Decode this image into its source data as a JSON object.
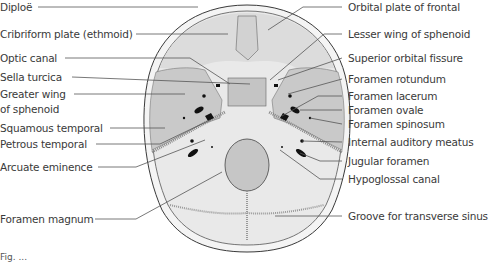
{
  "figure": {
    "caption_fragment": "Fig. ..."
  },
  "labels_left": [
    {
      "text": "Diploë",
      "y": 7
    },
    {
      "text": "Cribriform plate (ethmoid)",
      "y": 34
    },
    {
      "text": "Optic canal",
      "y": 58
    },
    {
      "text": "Sella turcica",
      "y": 77
    },
    {
      "text": "Greater wing",
      "y": 94
    },
    {
      "text": "of sphenoid",
      "y": 109
    },
    {
      "text": "Squamous temporal",
      "y": 128
    },
    {
      "text": "Petrous temporal",
      "y": 144
    },
    {
      "text": "Arcuate eminence",
      "y": 167
    },
    {
      "text": "Foramen magnum",
      "y": 219
    }
  ],
  "labels_right": [
    {
      "text": "Orbital plate of frontal",
      "y": 7
    },
    {
      "text": "Lesser wing of sphenoid",
      "y": 34
    },
    {
      "text": "Superior orbital fissure",
      "y": 58
    },
    {
      "text": "Foramen rotundum",
      "y": 79
    },
    {
      "text": "Foramen lacerum",
      "y": 96
    },
    {
      "text": "Foramen ovale",
      "y": 110
    },
    {
      "text": "Foramen spinosum",
      "y": 124
    },
    {
      "text": "Internal auditory meatus",
      "y": 142
    },
    {
      "text": "Jugular foramen",
      "y": 161
    },
    {
      "text": "Hypoglossal canal",
      "y": 179
    },
    {
      "text": "Groove for transverse sinus",
      "y": 216
    }
  ],
  "colors": {
    "bone_light": "#e9e9e9",
    "bone_shaded": "#c9c9c9",
    "diploe": "#f4f4f4",
    "outline": "#3a3a3a",
    "leader": "#555555",
    "foramen": "#111111"
  }
}
